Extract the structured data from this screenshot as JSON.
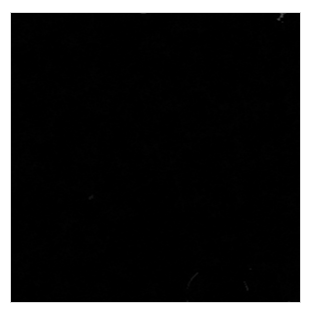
{
  "document": {
    "background_color": "#ffffff",
    "page_width": 318,
    "page_height": 316
  },
  "figure": {
    "name": "ct-skull-volume-rendering",
    "modality": "CT",
    "render_type": "3D volume rendering",
    "view": "lateral (sagittal profile), facing left",
    "colormap": "grayscale",
    "background_color": "#000000",
    "border_color": "#d8d8d8",
    "frame": {
      "x": 10,
      "y": 12,
      "width": 291,
      "height": 291
    },
    "anatomy_labels": [
      "cranial vault",
      "frontal bone",
      "parietal bone",
      "occipital bone",
      "lambdoid suture",
      "temporal bone",
      "zygomatic arch",
      "orbit",
      "nasal bone",
      "maxilla",
      "mandible",
      "dental arch",
      "mandibular condyle",
      "cervical vertebrae"
    ],
    "intensity": {
      "min_gray": 0,
      "max_gray": 238,
      "bone_mean_gray": 168,
      "air_gray": 4
    }
  },
  "chart_data": {
    "type": "heatmap",
    "title": "",
    "xlabel": "",
    "ylabel": "",
    "grid": false,
    "legend": "none",
    "colormap": "gray",
    "vmin": 0,
    "vmax": 255,
    "extent": [
      0,
      291,
      0,
      291
    ],
    "regions": [
      {
        "name": "cranial-vault",
        "cx": 168,
        "cy": 92,
        "rx": 118,
        "ry": 88,
        "gray": 196
      },
      {
        "name": "occipital-bone",
        "cx": 232,
        "cy": 160,
        "rx": 68,
        "ry": 62,
        "gray": 186
      },
      {
        "name": "frontal-bone",
        "cx": 100,
        "cy": 86,
        "rx": 52,
        "ry": 58,
        "gray": 172
      },
      {
        "name": "temporal-bone",
        "cx": 150,
        "cy": 148,
        "rx": 56,
        "ry": 40,
        "gray": 150
      },
      {
        "name": "facial-bones",
        "cx": 62,
        "cy": 140,
        "rx": 34,
        "ry": 56,
        "gray": 138
      },
      {
        "name": "orbit-cavity",
        "cx": 58,
        "cy": 118,
        "rx": 10,
        "ry": 13,
        "gray": 18
      },
      {
        "name": "zygomatic-arch",
        "cx": 122,
        "cy": 168,
        "rx": 44,
        "ry": 11,
        "gray": 168
      },
      {
        "name": "mandible-ramus",
        "cx": 118,
        "cy": 212,
        "rx": 40,
        "ry": 30,
        "gray": 162
      },
      {
        "name": "mandible-body",
        "cx": 72,
        "cy": 248,
        "rx": 58,
        "ry": 20,
        "gray": 176
      },
      {
        "name": "dental-arch",
        "cx": 70,
        "cy": 246,
        "rx": 56,
        "ry": 12,
        "gray": 206
      },
      {
        "name": "cervical-spine",
        "cx": 186,
        "cy": 248,
        "rx": 36,
        "ry": 60,
        "gray": 150
      },
      {
        "name": "air-background",
        "cx": 30,
        "cy": 40,
        "rx": 30,
        "ry": 34,
        "gray": 3
      }
    ]
  }
}
